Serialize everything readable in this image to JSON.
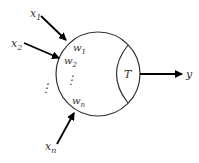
{
  "diagram": {
    "inputs": [
      {
        "label": "x",
        "sub": "1"
      },
      {
        "label": "x",
        "sub": "2"
      },
      {
        "label": "x",
        "sub": "n"
      }
    ],
    "weights": [
      {
        "label": "w",
        "sub": "1"
      },
      {
        "label": "w",
        "sub": "2"
      },
      {
        "label": "w",
        "sub": "n"
      }
    ],
    "ellipsis": "⋮",
    "transfer_label": "T",
    "output_label": "y",
    "colors": {
      "stroke": "#333333",
      "arrow": "#000000",
      "text": "#333333"
    }
  }
}
